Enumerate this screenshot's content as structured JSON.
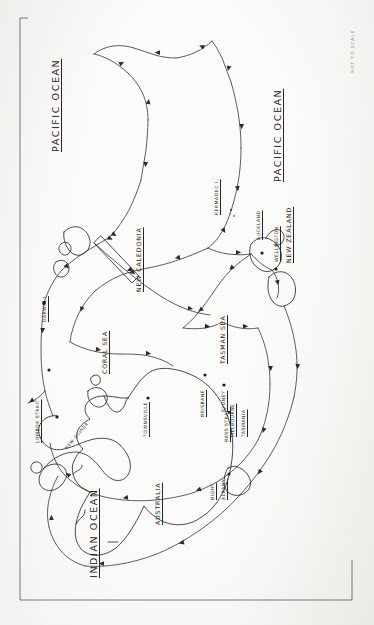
{
  "figure": {
    "kind": "hand-drawn-sketch-map",
    "orientation": "landscape map printed rotated 90 degrees; all labels read bottom-to-top",
    "scale_note": "NOT TO SCALE",
    "background_color": "#fbfbfa",
    "ink_color": "#2a2a2a"
  },
  "oceans": [
    {
      "name": "PACIFIC OCEAN",
      "placement": "upper-left of sheet"
    },
    {
      "name": "PACIFIC OCEAN",
      "placement": "upper-right of sheet"
    },
    {
      "name": "INDIAN OCEAN",
      "placement": "lower-left of sheet"
    }
  ],
  "seas": [
    {
      "name": "CORAL SEA"
    },
    {
      "name": "TASMAN SEA"
    }
  ],
  "landmasses": [
    {
      "name": "AUSTRALIA"
    },
    {
      "name": "NEW GUINEA"
    },
    {
      "name": "NEW CALEDONIA"
    },
    {
      "name": "NEW ZEALAND"
    },
    {
      "name": "TASMANIA"
    }
  ],
  "islands": [
    {
      "name": "KERMADEC I."
    }
  ],
  "straits_and_features": [
    {
      "name": "LOMBOK STRAIT"
    },
    {
      "name": "BASS STRAIT"
    },
    {
      "name": "BIGHT"
    }
  ],
  "ports": [
    {
      "name": "DARWIN",
      "marker": "dot"
    },
    {
      "name": "TOWNSVILLE",
      "marker": "dot"
    },
    {
      "name": "BRISBANE",
      "marker": "dot"
    },
    {
      "name": "SYDNEY",
      "marker": "dot"
    },
    {
      "name": "MELBOURNE",
      "marker": "dot"
    },
    {
      "name": "ALBANY",
      "marker": "dot"
    },
    {
      "name": "AUCKLAND",
      "marker": "dot"
    },
    {
      "name": "WELLINGTON",
      "marker": "dot"
    }
  ],
  "labels": {
    "pacific_ocean_left": "PACIFIC OCEAN",
    "pacific_ocean_right": "PACIFIC OCEAN",
    "indian_ocean": "INDIAN OCEAN",
    "coral_sea": "CORAL SEA",
    "tasman_sea": "TASMAN SEA",
    "australia": "AUSTRALIA",
    "new_guinea": "NEW GUINEA",
    "new_caledonia": "NEW CALEDONIA",
    "new_zealand": "NEW ZEALAND",
    "tasmania": "TASMANIA",
    "kermadec": "KERMADEC I.",
    "lombok_strait": "LOMBOK STRAIT",
    "bass_strait": "BASS STRAIT",
    "bight": "BIGHT",
    "darwin": "DARWIN I",
    "townsville": "TOWNSVILLE",
    "brisbane": "BRISBANE",
    "sydney": "SYDNEY",
    "melbourne": "MELBOURNE",
    "albany": "ALBANY",
    "auckland": "AUCKLAND",
    "wellington": "WELLINGTON",
    "not_to_scale": "NOT TO SCALE"
  },
  "route": {
    "description": "Single continuous voyage track with directional arrowheads drawn along the line",
    "arrow_count": 31,
    "stops_in_order": [
      "DARWIN",
      "LOMBOK STRAIT",
      "ALBANY",
      "MELBOURNE",
      "BASS STRAIT",
      "SYDNEY",
      "BRISBANE",
      "TOWNSVILLE",
      "CORAL SEA",
      "NEW CALEDONIA",
      "AUCKLAND",
      "WELLINGTON",
      "KERMADEC I.",
      "PACIFIC OCEAN"
    ]
  }
}
